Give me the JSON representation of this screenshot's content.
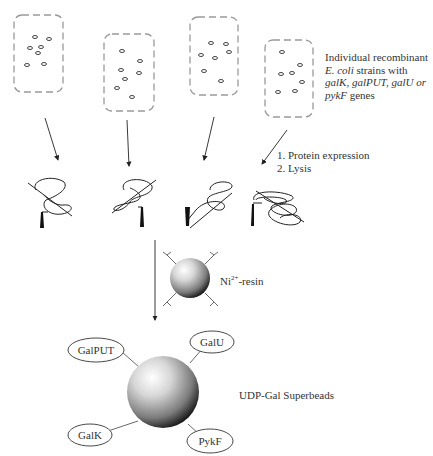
{
  "figure": {
    "cells": {
      "caption_line1": "Individual recombinant",
      "caption_line2_italic": "E. coli",
      "caption_line2_rest": " strains with",
      "caption_line3_italic": "galK, galPUT, galU or",
      "caption_line4_italic": "pykF",
      "caption_line4_rest": " genes",
      "count": 4
    },
    "steps": {
      "step1": "1. Protein expression",
      "step2": "2. Lysis"
    },
    "resin": {
      "label_prefix": "Ni",
      "label_sup": "2+",
      "label_suffix": "-resin"
    },
    "superbead": {
      "label": "UDP-Gal Superbeads",
      "enzymes": [
        "GalPUT",
        "GalU",
        "GalK",
        "PykF"
      ]
    },
    "colors": {
      "cell_outline": "#9a9a9a",
      "line": "#222222",
      "bead_light": "#f4f4f4",
      "bead_dark": "#1a1a1a"
    }
  }
}
